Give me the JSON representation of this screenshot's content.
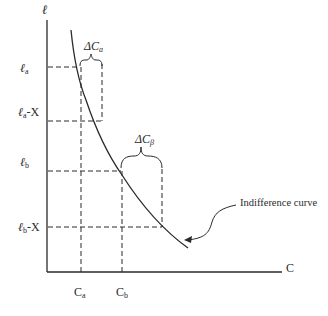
{
  "diagram": {
    "type": "indifference-curve",
    "y_axis_label": "ℓ",
    "x_axis_label": "C",
    "y_ticks": [
      {
        "main": "ℓ",
        "sub": "a",
        "suffix": ""
      },
      {
        "main": "ℓ",
        "sub": "a",
        "suffix": "-X"
      },
      {
        "main": "ℓ",
        "sub": "b",
        "suffix": ""
      },
      {
        "main": "ℓ",
        "sub": "b",
        "suffix": "-X"
      }
    ],
    "x_ticks": [
      {
        "main": "C",
        "sub": "a"
      },
      {
        "main": "C",
        "sub": "b"
      }
    ],
    "braces": [
      {
        "main": "ΔC",
        "sub": "a"
      },
      {
        "main": "ΔC",
        "sub": "β"
      }
    ],
    "annotation": "Indifference curve",
    "colors": {
      "line": "#2a2a2a",
      "background": "#ffffff"
    }
  }
}
